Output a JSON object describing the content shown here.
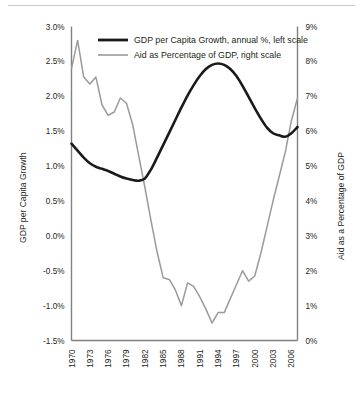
{
  "chart_data": {
    "type": "line",
    "title": "",
    "subtitle": "",
    "xlabel": "",
    "ylabel": "GDP per Capita Growth",
    "y2label": "Aid as a Percentage of GDP",
    "grid": false,
    "legend_position": "top-center",
    "xlim": [
      1970,
      2007
    ],
    "ylim": [
      -1.5,
      3.0
    ],
    "y2lim": [
      0,
      9
    ],
    "yticks": [
      "-1.5%",
      "-1.0%",
      "-0.5%",
      "0.0%",
      "0.5%",
      "1.0%",
      "1.5%",
      "2.0%",
      "2.5%",
      "3.0%"
    ],
    "ytick_values": [
      -1.5,
      -1.0,
      -0.5,
      0.0,
      0.5,
      1.0,
      1.5,
      2.0,
      2.5,
      3.0
    ],
    "y2ticks": [
      "0%",
      "1%",
      "2%",
      "3%",
      "4%",
      "5%",
      "6%",
      "7%",
      "8%",
      "9%"
    ],
    "y2tick_values": [
      0,
      1,
      2,
      3,
      4,
      5,
      6,
      7,
      8,
      9
    ],
    "xticks": [
      "1970",
      "1973",
      "1976",
      "1979",
      "1982",
      "1985",
      "1988",
      "1991",
      "1994",
      "1997",
      "2000",
      "2003",
      "2006"
    ],
    "xtick_values": [
      1970,
      1973,
      1976,
      1979,
      1982,
      1985,
      1988,
      1991,
      1994,
      1997,
      2000,
      2003,
      2006
    ],
    "x": [
      1970,
      1971,
      1972,
      1973,
      1974,
      1975,
      1976,
      1977,
      1978,
      1979,
      1980,
      1981,
      1982,
      1983,
      1984,
      1985,
      1986,
      1987,
      1988,
      1989,
      1990,
      1991,
      1992,
      1993,
      1994,
      1995,
      1996,
      1997,
      1998,
      1999,
      2000,
      2001,
      2002,
      2003,
      2004,
      2005,
      2006,
      2007
    ],
    "series": [
      {
        "name": "GDP per Capita Growth, annual %, left scale",
        "axis": "left",
        "color": "#1a1a1a",
        "unit": "%",
        "values": [
          1.32,
          1.22,
          1.12,
          1.04,
          0.99,
          0.96,
          0.93,
          0.89,
          0.85,
          0.82,
          0.8,
          0.79,
          0.82,
          0.95,
          1.12,
          1.3,
          1.48,
          1.66,
          1.84,
          2.01,
          2.16,
          2.29,
          2.39,
          2.45,
          2.47,
          2.45,
          2.39,
          2.29,
          2.15,
          1.99,
          1.83,
          1.68,
          1.55,
          1.47,
          1.44,
          1.42,
          1.47,
          1.56
        ]
      },
      {
        "name": "Aid as Percentage of GDP, right scale",
        "axis": "right",
        "color": "#9a9a9a",
        "unit": "%",
        "values": [
          7.8,
          8.6,
          7.55,
          7.35,
          7.55,
          6.75,
          6.45,
          6.55,
          6.95,
          6.8,
          6.2,
          5.3,
          4.4,
          3.45,
          2.55,
          1.8,
          1.75,
          1.45,
          1.0,
          1.65,
          1.55,
          1.25,
          0.9,
          0.5,
          0.8,
          0.8,
          1.2,
          1.6,
          2.0,
          1.7,
          1.85,
          2.5,
          3.25,
          4.0,
          4.7,
          5.4,
          6.3,
          6.95
        ]
      }
    ]
  },
  "legend": {
    "entries": [
      {
        "label": "GDP per Capita Growth, annual %, left scale",
        "color": "#1a1a1a"
      },
      {
        "label": "Aid as Percentage of GDP, right scale",
        "color": "#9a9a9a"
      }
    ]
  },
  "axes": {
    "left_title": "GDP per Capita Growth",
    "right_title": "Aid as a Percentage of GDP"
  }
}
